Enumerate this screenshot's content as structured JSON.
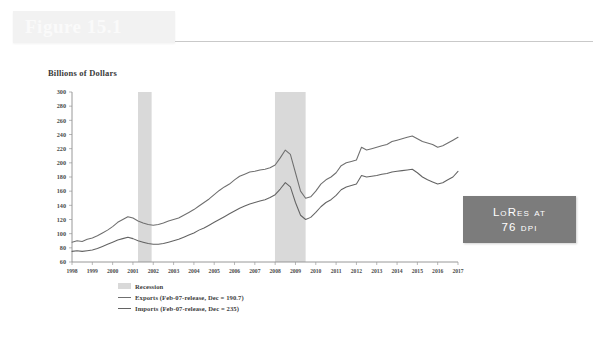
{
  "figure": {
    "title": "Figure 15.1",
    "badge_line1": "LoRes at",
    "badge_line2": "76 dpi"
  },
  "chart_data": {
    "type": "line",
    "title": "",
    "ylabel": "Billions of Dollars",
    "xlabel": "",
    "ylim": [
      60,
      300
    ],
    "ytick_values": [
      300,
      280,
      260,
      240,
      220,
      200,
      180,
      160,
      140,
      120,
      100,
      80,
      60
    ],
    "xlim": [
      1998,
      2017
    ],
    "xtick_values": [
      1998,
      1999,
      2000,
      2001,
      2002,
      2003,
      2004,
      2005,
      2006,
      2007,
      2008,
      2009,
      2010,
      2011,
      2012,
      2013,
      2014,
      2015,
      2016,
      2017
    ],
    "grid": false,
    "legend_position": "below",
    "legend": [
      {
        "key": "recession",
        "label": "Recession",
        "marker": "band",
        "color": "#d9d9d9"
      },
      {
        "key": "exports",
        "label": "Exports (Feb-07-release, Dec = 190.7)",
        "marker": "line",
        "color": "#6f6f6f"
      },
      {
        "key": "imports",
        "label": "Imports (Feb-07-release, Dec = 235)",
        "marker": "line",
        "color": "#636363"
      }
    ],
    "recessions": [
      {
        "start": 2001.25,
        "end": 2001.92
      },
      {
        "start": 2007.99,
        "end": 2009.5
      }
    ],
    "series": [
      {
        "name": "Imports",
        "color": "#6f6f6f",
        "x": [
          1998.0,
          1998.25,
          1998.5,
          1998.75,
          1999.0,
          1999.25,
          1999.5,
          1999.75,
          2000.0,
          2000.25,
          2000.5,
          2000.75,
          2001.0,
          2001.25,
          2001.5,
          2001.75,
          2002.0,
          2002.25,
          2002.5,
          2002.75,
          2003.0,
          2003.25,
          2003.5,
          2003.75,
          2004.0,
          2004.25,
          2004.5,
          2004.75,
          2005.0,
          2005.25,
          2005.5,
          2005.75,
          2006.0,
          2006.25,
          2006.5,
          2006.75,
          2007.0,
          2007.25,
          2007.5,
          2007.75,
          2008.0,
          2008.25,
          2008.5,
          2008.75,
          2009.0,
          2009.25,
          2009.5,
          2009.75,
          2010.0,
          2010.25,
          2010.5,
          2010.75,
          2011.0,
          2011.25,
          2011.5,
          2011.75,
          2012.0,
          2012.25,
          2012.5,
          2012.75,
          2013.0,
          2013.25,
          2013.5,
          2013.75,
          2014.0,
          2014.25,
          2014.5,
          2014.75,
          2015.0,
          2015.25,
          2015.5,
          2015.75,
          2016.0,
          2016.25,
          2016.5,
          2016.75,
          2017.0
        ],
        "y": [
          88,
          90,
          89,
          92,
          94,
          97,
          101,
          105,
          110,
          116,
          120,
          124,
          122,
          118,
          115,
          113,
          112,
          113,
          115,
          118,
          120,
          122,
          126,
          130,
          134,
          139,
          144,
          149,
          155,
          161,
          166,
          170,
          176,
          181,
          184,
          187,
          188,
          190,
          191,
          193,
          197,
          207,
          218,
          212,
          186,
          160,
          150,
          152,
          160,
          170,
          176,
          180,
          186,
          196,
          200,
          202,
          204,
          222,
          218,
          220,
          222,
          224,
          226,
          230,
          232,
          234,
          236,
          238,
          234,
          230,
          228,
          226,
          222,
          224,
          228,
          232,
          236
        ]
      },
      {
        "name": "Exports",
        "color": "#636363",
        "x": [
          1998.0,
          1998.25,
          1998.5,
          1998.75,
          1999.0,
          1999.25,
          1999.5,
          1999.75,
          2000.0,
          2000.25,
          2000.5,
          2000.75,
          2001.0,
          2001.25,
          2001.5,
          2001.75,
          2002.0,
          2002.25,
          2002.5,
          2002.75,
          2003.0,
          2003.25,
          2003.5,
          2003.75,
          2004.0,
          2004.25,
          2004.5,
          2004.75,
          2005.0,
          2005.25,
          2005.5,
          2005.75,
          2006.0,
          2006.25,
          2006.5,
          2006.75,
          2007.0,
          2007.25,
          2007.5,
          2007.75,
          2008.0,
          2008.25,
          2008.5,
          2008.75,
          2009.0,
          2009.25,
          2009.5,
          2009.75,
          2010.0,
          2010.25,
          2010.5,
          2010.75,
          2011.0,
          2011.25,
          2011.5,
          2011.75,
          2012.0,
          2012.25,
          2012.5,
          2012.75,
          2013.0,
          2013.25,
          2013.5,
          2013.75,
          2014.0,
          2014.25,
          2014.5,
          2014.75,
          2015.0,
          2015.25,
          2015.5,
          2015.75,
          2016.0,
          2016.25,
          2016.5,
          2016.75,
          2017.0
        ],
        "y": [
          75,
          76,
          75,
          76,
          77,
          79,
          82,
          85,
          88,
          91,
          93,
          95,
          93,
          90,
          88,
          86,
          85,
          85,
          86,
          88,
          90,
          92,
          95,
          98,
          101,
          105,
          108,
          112,
          116,
          120,
          124,
          128,
          132,
          136,
          139,
          142,
          144,
          146,
          148,
          151,
          155,
          163,
          172,
          166,
          144,
          126,
          120,
          123,
          130,
          138,
          144,
          148,
          154,
          162,
          166,
          168,
          170,
          182,
          180,
          181,
          182,
          184,
          185,
          187,
          188,
          189,
          190,
          191,
          186,
          180,
          176,
          173,
          170,
          172,
          176,
          180,
          188
        ]
      }
    ]
  }
}
